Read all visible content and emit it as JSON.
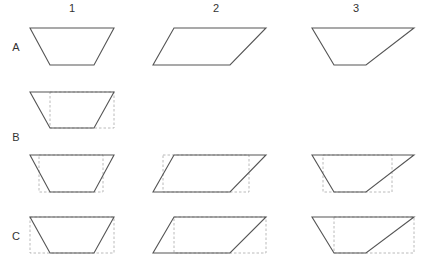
{
  "column_labels": [
    {
      "text": "1",
      "x": 72,
      "y": 12
    },
    {
      "text": "2",
      "x": 216,
      "y": 12
    },
    {
      "text": "3",
      "x": 356,
      "y": 12
    }
  ],
  "row_labels": [
    {
      "text": "A",
      "x": 16,
      "y": 51
    },
    {
      "text": "B",
      "x": 16,
      "y": 141
    },
    {
      "text": "C",
      "x": 16,
      "y": 240
    }
  ],
  "colors": {
    "shape_stroke": "#555555",
    "guide_stroke": "#a8a8a8",
    "label": "#333333",
    "background": "#ffffff"
  },
  "shapes": [
    {
      "id": "A1",
      "points": "30,28 114,28 94,65 50,65",
      "guide": null
    },
    {
      "id": "A2",
      "points": "174,28 266,28 230,65 153,65",
      "guide": null
    },
    {
      "id": "A3",
      "points": "312,28 414,28 366,65 334,65",
      "guide": null
    },
    {
      "id": "A1-extra",
      "points": "30,92 114,92 94,128 50,128",
      "guide": {
        "x": 50,
        "y": 92,
        "w": 64,
        "h": 36
      }
    },
    {
      "id": "B1",
      "points": "30,155 114,155 94,192 50,192",
      "guide": {
        "x": 39,
        "y": 155,
        "w": 64,
        "h": 37
      }
    },
    {
      "id": "B2",
      "points": "174,155 266,155 230,192 153,192",
      "guide": {
        "x": 163,
        "y": 155,
        "w": 86,
        "h": 37
      }
    },
    {
      "id": "B3",
      "points": "312,155 414,155 366,192 334,192",
      "guide": {
        "x": 323,
        "y": 155,
        "w": 69,
        "h": 37
      }
    },
    {
      "id": "C1",
      "points": "30,217 114,217 94,253 50,253",
      "guide": {
        "x": 30,
        "y": 217,
        "w": 84,
        "h": 36
      }
    },
    {
      "id": "C2",
      "points": "174,217 266,217 230,253 153,253",
      "guide": {
        "x": 174,
        "y": 217,
        "w": 92,
        "h": 36
      }
    },
    {
      "id": "C3",
      "points": "312,217 414,217 366,253 334,253",
      "guide": {
        "x": 334,
        "y": 217,
        "w": 80,
        "h": 36
      }
    }
  ]
}
